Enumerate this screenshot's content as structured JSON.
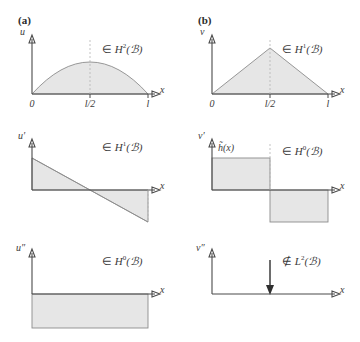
{
  "figure": {
    "panels": [
      {
        "tag": "(a)",
        "rows": [
          {
            "yaxis_label": "u",
            "xaxis_label": "x",
            "space_relation": "∈",
            "space_name": "H",
            "space_exponent": "2",
            "space_domain": "(ℬ)",
            "ticks": [
              "0",
              "l/2",
              "l"
            ],
            "shape": "halfsine"
          },
          {
            "yaxis_label": "u′",
            "xaxis_label": "x",
            "space_relation": "∈",
            "space_name": "H",
            "space_exponent": "1",
            "space_domain": "(ℬ)",
            "ticks": [],
            "shape": "ramp"
          },
          {
            "yaxis_label": "u″",
            "xaxis_label": "x",
            "space_relation": "∈",
            "space_name": "H",
            "space_exponent": "0",
            "space_domain": "(ℬ)",
            "ticks": [],
            "shape": "constant-negative"
          }
        ]
      },
      {
        "tag": "(b)",
        "rows": [
          {
            "yaxis_label": "v",
            "xaxis_label": "x",
            "space_relation": "∈",
            "space_name": "H",
            "space_exponent": "1",
            "space_domain": "(ℬ)",
            "ticks": [
              "0",
              "l/2",
              "l"
            ],
            "shape": "tent"
          },
          {
            "yaxis_label": "v′",
            "xaxis_label": "x",
            "space_relation": "∈",
            "space_name": "H",
            "space_exponent": "0",
            "space_domain": "(ℬ)",
            "ticks": [],
            "shape": "step",
            "curve_label": "h̃(x)"
          },
          {
            "yaxis_label": "v″",
            "xaxis_label": "x",
            "space_relation": "∉",
            "space_name": "L",
            "space_exponent": "2",
            "space_domain": "(ℬ)",
            "ticks": [],
            "shape": "dirac-delta"
          }
        ]
      }
    ],
    "colors": {
      "fill": "#e6e6e6",
      "outline": "#8c8c8c",
      "axis": "#4a4a4a",
      "dashed": "#b4b4b4",
      "text": "#3a3a3a",
      "background": "#ffffff"
    }
  }
}
